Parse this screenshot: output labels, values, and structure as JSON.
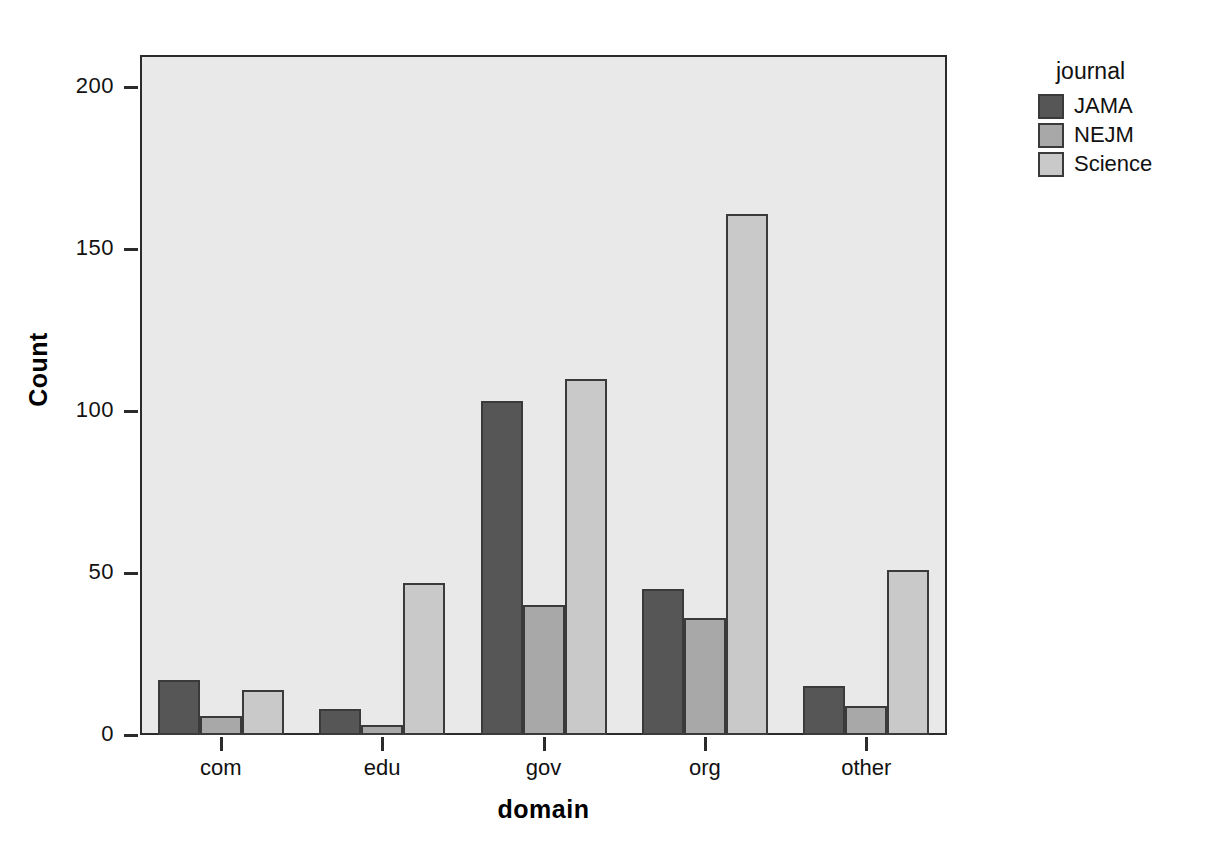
{
  "chart_data": {
    "type": "bar",
    "title": "",
    "xlabel": "domain",
    "ylabel": "Count",
    "categories": [
      "com",
      "edu",
      "gov",
      "org",
      "other"
    ],
    "series": [
      {
        "name": "JAMA",
        "color": "#565656",
        "values": [
          17,
          8,
          103,
          45,
          15
        ]
      },
      {
        "name": "NEJM",
        "color": "#a8a8a8",
        "values": [
          6,
          3,
          40,
          36,
          9
        ]
      },
      {
        "name": "Science",
        "color": "#c9c9c9",
        "values": [
          14,
          47,
          110,
          161,
          51
        ]
      }
    ],
    "ylim": [
      0,
      210
    ],
    "yticks": [
      0,
      50,
      100,
      150,
      200
    ],
    "ytick_labels": [
      "0",
      "50",
      "100",
      "150",
      "200"
    ],
    "grid": false,
    "legend_position": "right",
    "legend_title": "journal",
    "plot_background": "#e9e9e9",
    "axis_color": "#2b2b2b"
  }
}
